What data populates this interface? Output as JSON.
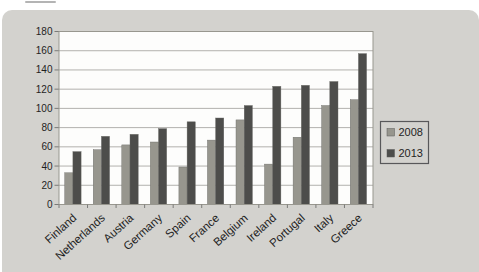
{
  "chart_data": {
    "type": "bar",
    "title": "",
    "xlabel": "",
    "ylabel": "",
    "categories": [
      "Finland",
      "Netherlands",
      "Austria",
      "Germany",
      "Spain",
      "France",
      "Belgium",
      "Ireland",
      "Portugal",
      "Italy",
      "Greece"
    ],
    "series": [
      {
        "name": "2008",
        "color": "#97968e",
        "values": [
          33,
          57,
          62,
          65,
          39,
          67,
          88,
          42,
          70,
          103,
          109
        ]
      },
      {
        "name": "2013",
        "color": "#4d4d4b",
        "values": [
          55,
          71,
          73,
          79,
          86,
          90,
          103,
          123,
          124,
          128,
          157
        ]
      }
    ],
    "ylim": [
      0,
      180
    ],
    "ytick_step": 20,
    "grid": true,
    "legend_position": "right"
  },
  "colors": {
    "panel_bg": "#d3d2ce",
    "plot_bg": "#fdfdfc",
    "gridline": "#b2b1ae",
    "frame": "#98978f",
    "tick": "#7a7a78",
    "axis_text": "#1f1f1f",
    "legend_bg": "#d3d2ce",
    "legend_border": "#58585a",
    "top_dash": "#b4b4b4"
  }
}
